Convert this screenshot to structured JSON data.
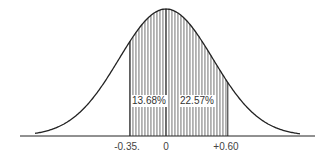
{
  "chart_data": {
    "type": "area",
    "title": "",
    "xlabel": "",
    "ylabel": "",
    "x_ticks": [
      "-0.35",
      "0",
      "+0.60"
    ],
    "shaded_range": [
      -0.35,
      0.6
    ],
    "regions": [
      {
        "from": -0.35,
        "to": 0,
        "area_label": "13.68%"
      },
      {
        "from": 0,
        "to": 0.6,
        "area_label": "22.57%"
      }
    ],
    "grid": false,
    "legend": "none"
  },
  "labels": {
    "left_area": "13.68%",
    "right_area": "22.57%",
    "tick_left": "-0.35.",
    "tick_mid": "0",
    "tick_right": "+0.60"
  },
  "colors": {
    "line": "#222222",
    "hatch": "#333333",
    "background": "#ffffff"
  }
}
